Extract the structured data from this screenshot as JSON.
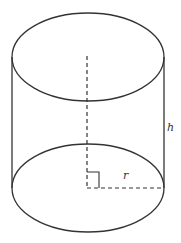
{
  "diagram": {
    "type": "cylinder",
    "labels": {
      "height": "h",
      "radius": "r"
    },
    "colors": {
      "stroke": "#333333",
      "background": "#ffffff"
    },
    "elements": [
      "top ellipse (solid)",
      "bottom ellipse (solid)",
      "two vertical side edges",
      "dashed central axis",
      "dashed radius line",
      "right-angle marker at base center"
    ]
  }
}
